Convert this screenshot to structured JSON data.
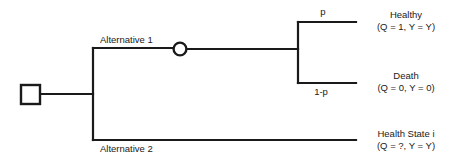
{
  "diagram": {
    "type": "decision-tree",
    "nodes": {
      "decision_node": {
        "shape": "square",
        "label": ""
      },
      "chance_node": {
        "shape": "circle",
        "label": ""
      }
    },
    "branches": [
      {
        "id": "alternative-1",
        "label": "Alternative 1"
      },
      {
        "id": "alternative-2",
        "label": "Alternative 2"
      }
    ],
    "probabilities": [
      {
        "id": "p-healthy",
        "label": "p"
      },
      {
        "id": "p-death",
        "label": "1-p"
      }
    ],
    "outcomes": [
      {
        "id": "healthy",
        "name": "Healthy",
        "payoff": "(Q = 1, Y = Y)"
      },
      {
        "id": "death",
        "name": "Death",
        "payoff": "(Q = 0, Y = 0)"
      },
      {
        "id": "health-state-i",
        "name": "Health State i",
        "payoff": "(Q = ?, Y = Y)"
      }
    ],
    "colors": {
      "line": "#1a1a1a",
      "background": "#ffffff",
      "text": "#1a1a1a"
    }
  }
}
